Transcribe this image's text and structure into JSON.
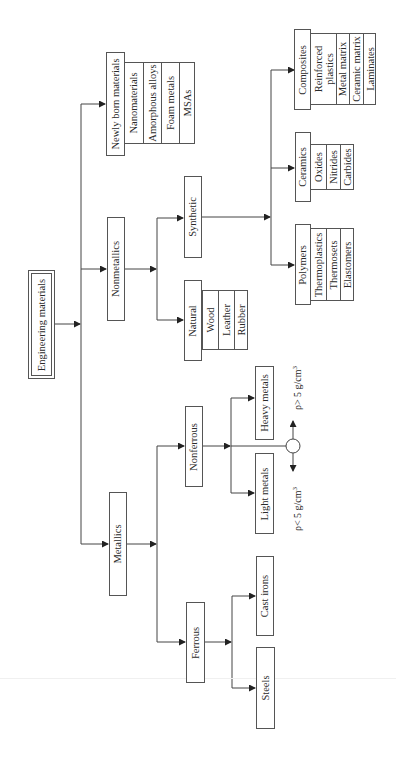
{
  "diagram": {
    "orientation": "rotated-90-ccw",
    "root": {
      "label": "Engineering materials"
    },
    "categories": [
      {
        "id": "newly",
        "label": "Newly born materials",
        "items": [
          "Nanomaterials",
          "Amorphous alloys",
          "Foam metals",
          "MSAs"
        ]
      },
      {
        "id": "nonmetallics",
        "label": "Nonmetallics",
        "children": [
          {
            "id": "synthetic",
            "label": "Synthetic",
            "children": [
              {
                "id": "composites",
                "label": "Composites",
                "items": [
                  "Reinforced plastics",
                  "Metal matrix",
                  "Ceramic matrix",
                  "Laminates"
                ]
              },
              {
                "id": "ceramics",
                "label": "Ceramics",
                "items": [
                  "Oxides",
                  "Nitrides",
                  "Carbides"
                ]
              },
              {
                "id": "polymers",
                "label": "Polymers",
                "items": [
                  "Thermoplastics",
                  "Thermosets",
                  "Elastomers"
                ]
              }
            ]
          },
          {
            "id": "natural",
            "label": "Natural",
            "items": [
              "Wood",
              "Leather",
              "Rubber"
            ]
          }
        ]
      },
      {
        "id": "metallics",
        "label": "Metallics",
        "children": [
          {
            "id": "nonferrous",
            "label": "Nonferrous",
            "children": [
              {
                "id": "heavy",
                "label": "Heavy metals"
              },
              {
                "id": "light",
                "label": "Light metals"
              }
            ],
            "density_split": {
              "above": "ρ> 5 g/cm",
              "below": "ρ< 5 g/cm",
              "exponent": "3"
            }
          },
          {
            "id": "ferrous",
            "label": "Ferrous",
            "children": [
              {
                "id": "cast",
                "label": "Cast irons"
              },
              {
                "id": "steels",
                "label": "Steels"
              }
            ]
          }
        ]
      }
    ]
  },
  "colors": {
    "line": "#444444",
    "border": "#555555",
    "text": "#2a2a2a",
    "background": "#ffffff"
  }
}
